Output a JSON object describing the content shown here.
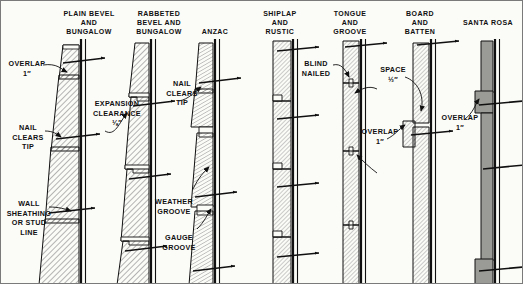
{
  "figure": {
    "kind": "wood-siding-application-details",
    "background_color": "#fbfbf8",
    "ink_color": "#101010",
    "hatch_color": "#6a6a6a",
    "santa_rosa_fill": "#9a9a96"
  },
  "panels": [
    {
      "id": "plain-bevel-and-bungalow",
      "title": "PLAIN BEVEL\nAND\nBUNGALOW",
      "title_x": 52,
      "title_y": 8,
      "title_w": 72
    },
    {
      "id": "rabbeted-bevel-and-bungalow",
      "title": "RABBETED\nBEVEL AND\nBUNGALOW",
      "title_x": 122,
      "title_y": 8,
      "title_w": 72
    },
    {
      "id": "anzac",
      "title": "ANZAC",
      "title_x": 186,
      "title_y": 26,
      "title_w": 56
    },
    {
      "id": "shiplap-and-rustic",
      "title": "SHIPLAP\nAND\nRUSTIC",
      "title_x": 248,
      "title_y": 8,
      "title_w": 62
    },
    {
      "id": "tongue-and-groove",
      "title": "TONGUE\nAND\nGROOVE",
      "title_x": 318,
      "title_y": 8,
      "title_w": 62
    },
    {
      "id": "board-and-batten",
      "title": "BOARD\nAND\nBATTEN",
      "title_x": 388,
      "title_y": 8,
      "title_w": 62
    },
    {
      "id": "santa-rosa",
      "title": "SANTA ROSA",
      "title_x": 455,
      "title_y": 17,
      "title_w": 64
    }
  ],
  "callouts": [
    {
      "id": "overlap-1in-left",
      "text": "OVERLAP\n1″",
      "x": 4,
      "y": 58,
      "w": 44,
      "align": "ctr"
    },
    {
      "id": "nail-clears-tip-left",
      "text": "NAIL\nCLEARS\nTIP",
      "x": 6,
      "y": 122,
      "w": 42,
      "align": "ctr"
    },
    {
      "id": "wall-sheathing-or-stud-line",
      "text": "WALL\nSHEATHING\nOR STUD\nLINE",
      "x": 2,
      "y": 198,
      "w": 52,
      "align": "ctr"
    },
    {
      "id": "expansion-clearance",
      "text": "EXPANSION\nCLEARANCE\n⅛″",
      "x": 88,
      "y": 98,
      "w": 56,
      "align": "ctr"
    },
    {
      "id": "nail-clears-tip-anzac",
      "text": "NAIL\nCLEARS\nTIP",
      "x": 160,
      "y": 78,
      "w": 42,
      "align": "ctr"
    },
    {
      "id": "weather-groove",
      "text": "WEATHER\nGROOVE",
      "x": 148,
      "y": 196,
      "w": 50,
      "align": "ctr"
    },
    {
      "id": "gauge-groove",
      "text": "GAUGE\nGROOVE",
      "x": 154,
      "y": 232,
      "w": 48,
      "align": "ctr"
    },
    {
      "id": "blind-nailed",
      "text": "BLIND\nNAILED",
      "x": 294,
      "y": 58,
      "w": 42,
      "align": "ctr"
    },
    {
      "id": "space-half-in",
      "text": "SPACE\n½″",
      "x": 372,
      "y": 64,
      "w": 40,
      "align": "ctr"
    },
    {
      "id": "overlap-1in-board-batten",
      "text": "OVERLAP\n1″",
      "x": 356,
      "y": 126,
      "w": 46,
      "align": "ctr"
    },
    {
      "id": "overlap-1in-santa-rosa",
      "text": "OVERLAP\n1″",
      "x": 436,
      "y": 112,
      "w": 46,
      "align": "ctr"
    }
  ]
}
